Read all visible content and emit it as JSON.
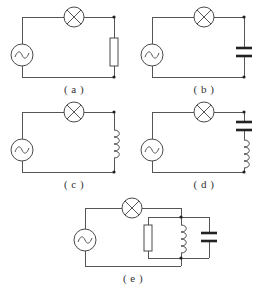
{
  "figure": {
    "background_color": "#ffffff",
    "wire_color": "#555555",
    "symbol_color": "#4a4a4a",
    "node_color": "#222222",
    "label_color": "#333333"
  },
  "circuits": [
    {
      "id": "a",
      "label": "( a )",
      "elements": [
        {
          "type": "ac-source",
          "symbol": "ac-source-icon",
          "position": "left-side"
        },
        {
          "type": "lamp",
          "symbol": "lamp-icon",
          "position": "top-branch"
        },
        {
          "type": "resistor",
          "symbol": "resistor-icon",
          "position": "right-side"
        }
      ],
      "topology": "series: AC source - lamp - resistor"
    },
    {
      "id": "b",
      "label": "( b )",
      "elements": [
        {
          "type": "ac-source",
          "symbol": "ac-source-icon",
          "position": "left-side"
        },
        {
          "type": "lamp",
          "symbol": "lamp-icon",
          "position": "top-branch"
        },
        {
          "type": "capacitor",
          "symbol": "capacitor-icon",
          "position": "right-side"
        }
      ],
      "topology": "series: AC source - lamp - capacitor"
    },
    {
      "id": "c",
      "label": "( c )",
      "elements": [
        {
          "type": "ac-source",
          "symbol": "ac-source-icon",
          "position": "left-side"
        },
        {
          "type": "lamp",
          "symbol": "lamp-icon",
          "position": "top-branch"
        },
        {
          "type": "inductor",
          "symbol": "inductor-icon",
          "position": "right-side"
        }
      ],
      "topology": "series: AC source - lamp - inductor"
    },
    {
      "id": "d",
      "label": "( d )",
      "elements": [
        {
          "type": "ac-source",
          "symbol": "ac-source-icon",
          "position": "left-side"
        },
        {
          "type": "lamp",
          "symbol": "lamp-icon",
          "position": "top-branch"
        },
        {
          "type": "capacitor",
          "symbol": "capacitor-icon",
          "position": "right-side-upper"
        },
        {
          "type": "inductor",
          "symbol": "inductor-icon",
          "position": "right-side-lower"
        }
      ],
      "topology": "series: AC source - lamp - capacitor - inductor"
    },
    {
      "id": "e",
      "label": "( e )",
      "elements": [
        {
          "type": "ac-source",
          "symbol": "ac-source-icon",
          "position": "left-side"
        },
        {
          "type": "lamp",
          "symbol": "lamp-icon",
          "position": "top-branch"
        },
        {
          "type": "resistor",
          "symbol": "resistor-icon",
          "position": "parallel-branch-1"
        },
        {
          "type": "inductor",
          "symbol": "inductor-icon",
          "position": "parallel-branch-2"
        },
        {
          "type": "capacitor",
          "symbol": "capacitor-icon",
          "position": "parallel-branch-3"
        }
      ],
      "topology": "AC source - lamp - parallel(resistor, inductor, capacitor)"
    }
  ]
}
